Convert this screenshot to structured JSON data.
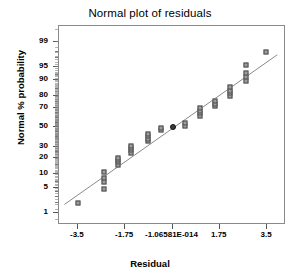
{
  "chart_data": {
    "type": "scatter",
    "title": "Normal plot of residuals",
    "xlabel": "Residual",
    "ylabel": "Normal % probability",
    "xlim": [
      -4.2,
      4.2
    ],
    "ylim": [
      0.4,
      99.7
    ],
    "grid": false,
    "legend": null,
    "y_scale": "normal-probability",
    "x_ticks": [
      -3.5,
      -1.75,
      0,
      1.75,
      3.5
    ],
    "x_tick_labels": [
      "-3.5",
      "-1.75",
      "-1.06581E-014",
      "1.75",
      "3.5"
    ],
    "y_ticks": [
      1,
      5,
      10,
      20,
      30,
      50,
      70,
      80,
      90,
      95,
      99
    ],
    "y_tick_labels": [
      "1",
      "5",
      "10",
      "20",
      "30",
      "50",
      "70",
      "80",
      "90",
      "95",
      "99"
    ],
    "y_minor_ticks": [
      2,
      3,
      4,
      7,
      15,
      25,
      40,
      45,
      55,
      60,
      65,
      75,
      85,
      92,
      97,
      98
    ],
    "reference_line": {
      "x": [
        -4.0,
        3.95
      ],
      "y": [
        1.6,
        97.5
      ],
      "color": "#888888",
      "width": 1
    },
    "series": [
      {
        "name": "residuals",
        "marker": "square",
        "color": "#9d9d9d",
        "edge_color": "#4a4a4a",
        "points": [
          {
            "x": -3.5,
            "y": 2.0
          },
          {
            "x": -2.55,
            "y": 4.8
          },
          {
            "x": -2.55,
            "y": 7.0
          },
          {
            "x": -2.55,
            "y": 8.3
          },
          {
            "x": -2.55,
            "y": 11.5
          },
          {
            "x": -2.02,
            "y": 15.5
          },
          {
            "x": -2.02,
            "y": 17.0
          },
          {
            "x": -2.02,
            "y": 18.5
          },
          {
            "x": -2.02,
            "y": 20.5
          },
          {
            "x": -1.52,
            "y": 24.5
          },
          {
            "x": -1.52,
            "y": 26.5
          },
          {
            "x": -1.52,
            "y": 28.5
          },
          {
            "x": -1.52,
            "y": 31.0
          },
          {
            "x": -0.92,
            "y": 35.0
          },
          {
            "x": -0.92,
            "y": 37.5
          },
          {
            "x": -0.92,
            "y": 40.5
          },
          {
            "x": -0.92,
            "y": 43.0
          },
          {
            "x": -0.42,
            "y": 47.0
          },
          {
            "x": -0.42,
            "y": 49.5
          },
          {
            "x": 0.48,
            "y": 51.5
          },
          {
            "x": 0.48,
            "y": 54.5
          },
          {
            "x": 1.03,
            "y": 62.0
          },
          {
            "x": 1.03,
            "y": 65.0
          },
          {
            "x": 1.03,
            "y": 67.5
          },
          {
            "x": 1.03,
            "y": 69.5
          },
          {
            "x": 1.58,
            "y": 71.5
          },
          {
            "x": 1.58,
            "y": 73.5
          },
          {
            "x": 1.58,
            "y": 76.0
          },
          {
            "x": 2.12,
            "y": 80.5
          },
          {
            "x": 2.12,
            "y": 82.5
          },
          {
            "x": 2.12,
            "y": 84.0
          },
          {
            "x": 2.12,
            "y": 86.0
          },
          {
            "x": 2.72,
            "y": 89.5
          },
          {
            "x": 2.72,
            "y": 91.5
          },
          {
            "x": 2.72,
            "y": 93.0
          },
          {
            "x": 2.72,
            "y": 95.5
          },
          {
            "x": 3.45,
            "y": 98.0
          }
        ]
      },
      {
        "name": "highlighted-point",
        "marker": "circle",
        "color": "#3a3a3a",
        "edge_color": "#111111",
        "points": [
          {
            "x": 0.02,
            "y": 50.0
          }
        ]
      }
    ]
  }
}
